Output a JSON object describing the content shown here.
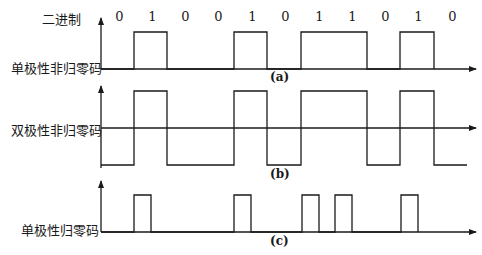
{
  "header": {
    "binary_label": "二进制"
  },
  "bits": [
    "0",
    "1",
    "0",
    "0",
    "1",
    "0",
    "1",
    "1",
    "0",
    "1",
    "0"
  ],
  "panels": [
    {
      "id": "a",
      "label": "单极性非归零码",
      "caption": "(a)"
    },
    {
      "id": "b",
      "label": "双极性非归零码",
      "caption": "(b)"
    },
    {
      "id": "c",
      "label": "单极性归零码",
      "caption": "(c)"
    }
  ],
  "colors": {
    "line": "#1a1a1a",
    "background": "#ffffff"
  }
}
